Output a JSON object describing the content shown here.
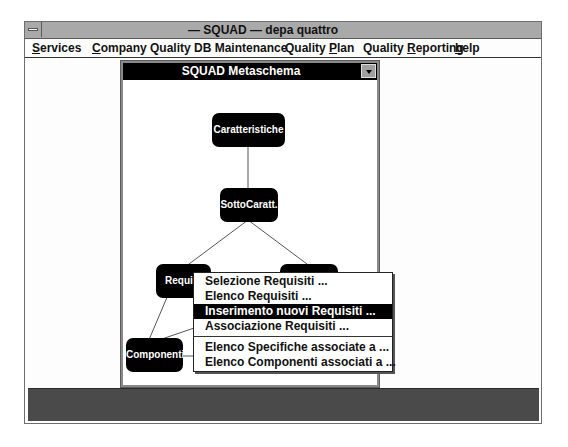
{
  "app": {
    "title": "— SQUAD —  depa quattro"
  },
  "menubar": {
    "items": [
      {
        "pre": "",
        "u": "S",
        "post": "ervices",
        "label": "Services"
      },
      {
        "pre": "",
        "u": "C",
        "post": "ompany Quality DB Maintenance",
        "label": "Company Quality DB Maintenance"
      },
      {
        "pre": "Quality ",
        "u": "P",
        "post": "lan",
        "label": "Quality Plan"
      },
      {
        "pre": "Quality ",
        "u": "R",
        "post": "eporting",
        "label": "Quality Reporting"
      },
      {
        "pre": "",
        "u": "h",
        "post": "elp",
        "label": "help"
      }
    ]
  },
  "metaschema": {
    "title": "SQUAD Metaschema",
    "nodes": [
      {
        "id": "caratteristiche",
        "label": "Caratteristiche"
      },
      {
        "id": "sottocaratt",
        "label": "SottoCaratt."
      },
      {
        "id": "requisiti",
        "label": "Requisiti"
      },
      {
        "id": "specifiche",
        "label": ""
      },
      {
        "id": "componenti",
        "label": "Componenti"
      },
      {
        "id": "node-bottom-mid",
        "label": ""
      },
      {
        "id": "node-bottom-right",
        "label": ""
      }
    ]
  },
  "context_menu": {
    "items": [
      {
        "label": "Selezione Requisiti ...",
        "selected": false
      },
      {
        "label": "Elenco Requisiti ...",
        "selected": false
      },
      {
        "label": "Inserimento nuovi Requisiti ...",
        "selected": true
      },
      {
        "label": "Associazione Requisiti ...",
        "selected": false
      },
      {
        "label": "Elenco Specifiche associate a ...",
        "selected": false
      },
      {
        "label": "Elenco Componenti associati a ...",
        "selected": false
      }
    ]
  },
  "colors": {
    "titlebar": "#a9a9a9",
    "meta_titlebar": "#000000",
    "node_fill": "#000000",
    "status_bar": "#4a4a4a",
    "menu_highlight": "#000000"
  }
}
